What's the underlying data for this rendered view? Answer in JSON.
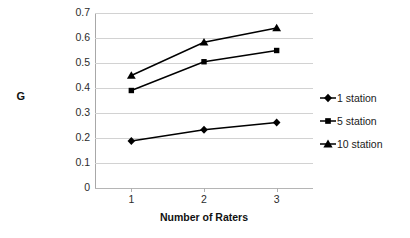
{
  "chart_data": {
    "type": "line",
    "title": "",
    "xlabel": "Number of Raters",
    "ylabel": "G",
    "x": [
      1,
      2,
      3
    ],
    "xtick_labels": [
      "1",
      "2",
      "3"
    ],
    "ytick_labels": [
      "0.7",
      "0.6",
      "0.5",
      "0.4",
      "0.3",
      "0.2",
      "0.1",
      "0"
    ],
    "ytick_values": [
      0.7,
      0.6,
      0.5,
      0.4,
      0.3,
      0.2,
      0.1,
      0
    ],
    "ylim": [
      0,
      0.7
    ],
    "xlim": [
      0.5,
      3.5
    ],
    "grid": "horizontal",
    "legend_position": "right",
    "series": [
      {
        "name": "1 station",
        "marker": "diamond",
        "color": "#000000",
        "values": [
          0.188,
          0.233,
          0.262
        ]
      },
      {
        "name": "5 station",
        "marker": "square",
        "color": "#000000",
        "values": [
          0.39,
          0.505,
          0.55
        ]
      },
      {
        "name": "10 station",
        "marker": "triangle",
        "color": "#000000",
        "values": [
          0.45,
          0.583,
          0.64
        ]
      }
    ]
  },
  "legend": {
    "items": [
      {
        "label": "1 station",
        "marker": "diamond"
      },
      {
        "label": "5 station",
        "marker": "square"
      },
      {
        "label": "10 station",
        "marker": "triangle"
      }
    ]
  },
  "axis": {
    "y_title": "G",
    "x_title": "Number of Raters"
  }
}
